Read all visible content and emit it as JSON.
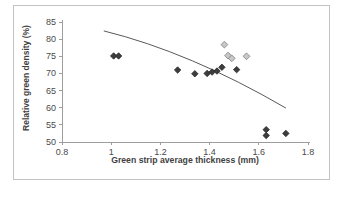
{
  "figure": {
    "border_color": "#c3c3c3",
    "background": "#ffffff"
  },
  "axis_style": {
    "line_color": "#9d9d9d",
    "tick_color": "#9d9d9d",
    "tick_label_color": "#4a4a4a",
    "title_color": "#3f3f3f"
  },
  "chart_data": {
    "type": "scatter",
    "title": "",
    "xlabel": "Green strip average thickness (mm)",
    "ylabel": "Relative green density (%)",
    "xlim": [
      0.8,
      1.8
    ],
    "ylim": [
      50,
      85
    ],
    "x_tick_values": [
      0.8,
      1.0,
      1.2,
      1.4,
      1.6,
      1.8
    ],
    "x_tick_labels": [
      "0.8",
      "1",
      "1.2",
      "1.4",
      "1.6",
      "1.8"
    ],
    "y_tick_values": [
      50,
      55,
      60,
      65,
      70,
      75,
      80,
      85
    ],
    "y_tick_labels": [
      "50",
      "55",
      "60",
      "65",
      "70",
      "75",
      "80",
      "85"
    ],
    "grid": false,
    "legend": "none",
    "series": [
      {
        "name": "dark-filled-diamonds",
        "marker": "diamond",
        "fill": "#3d3d3d",
        "stroke": "#262626",
        "size": 3.2,
        "points": [
          [
            1.01,
            75.1
          ],
          [
            1.03,
            75.1
          ],
          [
            1.27,
            71.0
          ],
          [
            1.34,
            69.9
          ],
          [
            1.39,
            70.0
          ],
          [
            1.41,
            70.4
          ],
          [
            1.43,
            70.7
          ],
          [
            1.45,
            71.8
          ],
          [
            1.51,
            71.1
          ],
          [
            1.63,
            53.6
          ],
          [
            1.63,
            51.9
          ],
          [
            1.71,
            52.5
          ]
        ]
      },
      {
        "name": "light-filled-diamonds",
        "marker": "diamond",
        "fill": "#c8c8c8",
        "stroke": "#7f7f7f",
        "size": 3.4,
        "points": [
          [
            1.46,
            78.4
          ],
          [
            1.475,
            75.2
          ],
          [
            1.49,
            74.4
          ],
          [
            1.55,
            75.0
          ]
        ]
      }
    ],
    "trendline": {
      "color": "#595959",
      "width": 1,
      "start": [
        0.97,
        82.4
      ],
      "control": [
        1.32,
        76.2
      ],
      "end": [
        1.71,
        59.9
      ]
    }
  }
}
